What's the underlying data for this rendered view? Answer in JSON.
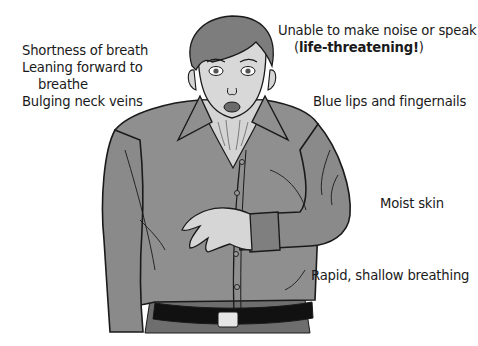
{
  "figure": {
    "colors": {
      "shirt": "#8f8f8f",
      "shirt_shade": "#7a7a7a",
      "skin": "#d4d4d4",
      "hair": "#7d7d7d",
      "belt": "#111111",
      "buckle": "#e6e6e6",
      "pants": "#6e6e6e",
      "outline": "#1a1a1a"
    }
  },
  "labels": {
    "left": {
      "line1": "Shortness of breath",
      "line2": "Leaning forward to",
      "line3": "breathe",
      "line4": "Bulging neck veins"
    },
    "speak": {
      "line1": "Unable to make noise or speak",
      "open_paren": "(",
      "emphasis": "life-threatening!",
      "close_paren": ")"
    },
    "blue_lips": "Blue lips and fingernails",
    "moist_skin": "Moist skin",
    "rapid_breathing": "Rapid, shallow breathing"
  }
}
